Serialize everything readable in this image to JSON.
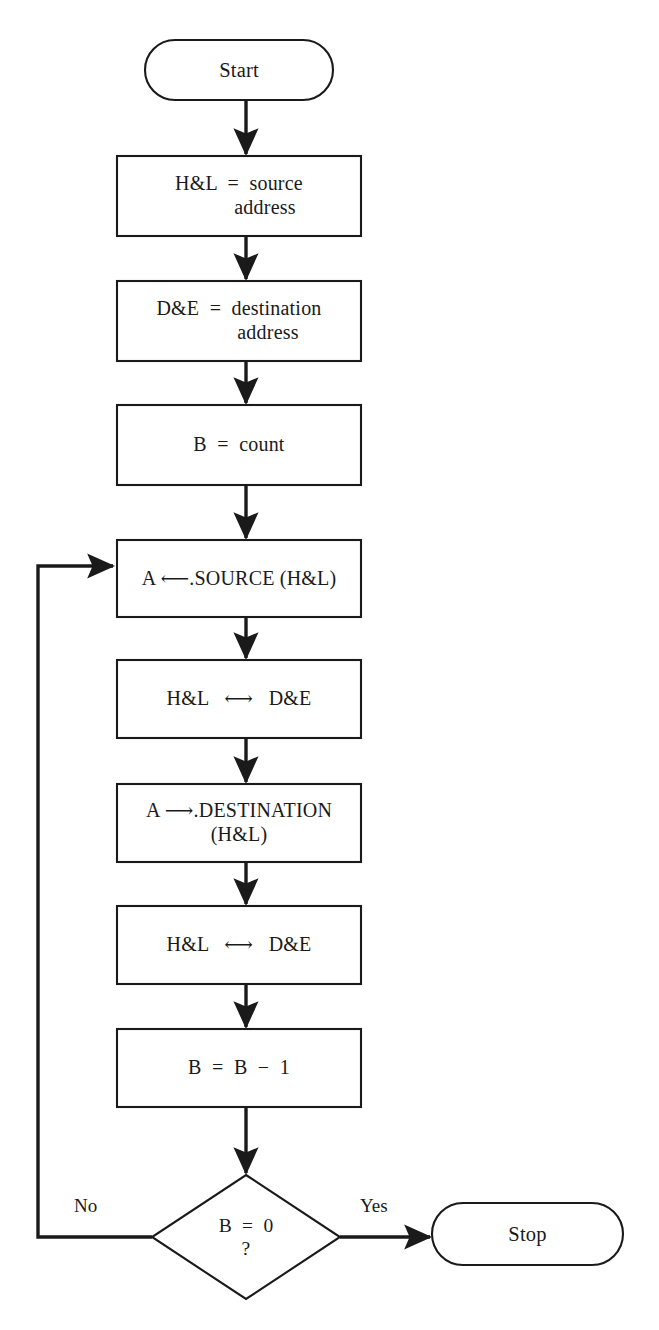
{
  "diagram": {
    "type": "flowchart",
    "background_color": "#ffffff",
    "line_color": "#1a1a1a",
    "nodes": [
      {
        "id": "start",
        "shape": "terminator",
        "name": "start-terminator",
        "lines": [
          "Start"
        ],
        "x": 145,
        "y": 40,
        "w": 188,
        "h": 60
      },
      {
        "id": "src_addr",
        "shape": "process",
        "name": "process-hl-source-address",
        "lines": [
          "H&L  =  source",
          "address"
        ],
        "x": 117,
        "y": 156,
        "w": 244,
        "h": 80
      },
      {
        "id": "dst_addr",
        "shape": "process",
        "name": "process-de-destination-address",
        "lines": [
          "D&E  =  destination",
          "address"
        ],
        "x": 117,
        "y": 281,
        "w": 244,
        "h": 80
      },
      {
        "id": "count",
        "shape": "process",
        "name": "process-b-count",
        "lines": [
          "B  =  count"
        ],
        "x": 117,
        "y": 405,
        "w": 244,
        "h": 80
      },
      {
        "id": "load_src",
        "shape": "process",
        "name": "process-a-load-source",
        "lines": [
          "A ⟵.SOURCE (H&L)"
        ],
        "x": 117,
        "y": 540,
        "w": 244,
        "h": 77
      },
      {
        "id": "swap1",
        "shape": "process",
        "name": "process-swap-hl-de-first",
        "lines": [
          "H&L   ⟷   D&E"
        ],
        "x": 117,
        "y": 660,
        "w": 244,
        "h": 78
      },
      {
        "id": "store_dst",
        "shape": "process",
        "name": "process-a-store-destination",
        "lines": [
          "A ⟶.DESTINATION",
          "(H&L)"
        ],
        "x": 117,
        "y": 784,
        "w": 244,
        "h": 78
      },
      {
        "id": "swap2",
        "shape": "process",
        "name": "process-swap-hl-de-second",
        "lines": [
          "H&L   ⟷   D&E"
        ],
        "x": 117,
        "y": 906,
        "w": 244,
        "h": 78
      },
      {
        "id": "dec_b",
        "shape": "process",
        "name": "process-decrement-b",
        "lines": [
          "B  =  B  −  1"
        ],
        "x": 117,
        "y": 1029,
        "w": 244,
        "h": 78
      },
      {
        "id": "test_b",
        "shape": "decision",
        "name": "decision-b-equals-zero",
        "lines": [
          "B  =  0",
          "?"
        ],
        "cx": 246,
        "cy": 1237,
        "hw": 94,
        "hh": 62
      },
      {
        "id": "stop",
        "shape": "terminator",
        "name": "stop-terminator",
        "lines": [
          "Stop"
        ],
        "x": 432,
        "y": 1203,
        "w": 191,
        "h": 62
      }
    ],
    "edges": [
      {
        "name": "edge-start-to-source-address",
        "from": "start",
        "to": "src_addr",
        "label": ""
      },
      {
        "name": "edge-source-address-to-destination-address",
        "from": "src_addr",
        "to": "dst_addr",
        "label": ""
      },
      {
        "name": "edge-destination-address-to-count",
        "from": "dst_addr",
        "to": "count",
        "label": ""
      },
      {
        "name": "edge-count-to-load-source",
        "from": "count",
        "to": "load_src",
        "label": ""
      },
      {
        "name": "edge-load-source-to-swap1",
        "from": "load_src",
        "to": "swap1",
        "label": ""
      },
      {
        "name": "edge-swap1-to-store-destination",
        "from": "swap1",
        "to": "store_dst",
        "label": ""
      },
      {
        "name": "edge-store-destination-to-swap2",
        "from": "store_dst",
        "to": "swap2",
        "label": ""
      },
      {
        "name": "edge-swap2-to-decrement-b",
        "from": "swap2",
        "to": "dec_b",
        "label": ""
      },
      {
        "name": "edge-decrement-b-to-decision",
        "from": "dec_b",
        "to": "test_b",
        "label": ""
      },
      {
        "name": "edge-decision-yes-to-stop",
        "from": "test_b",
        "to": "stop",
        "label": "Yes"
      },
      {
        "name": "edge-decision-no-loop-back",
        "from": "test_b",
        "to": "load_src",
        "label": "No"
      }
    ],
    "labels": {
      "no": "No",
      "yes": "Yes"
    }
  }
}
